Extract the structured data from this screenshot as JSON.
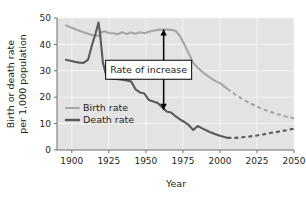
{
  "chart_data": {
    "type": "line",
    "title": "",
    "xlabel": "Year",
    "ylabel": "Birth or death rate\nper 1,000 population",
    "ylabel_line1": "Birth or death rate",
    "ylabel_line2": "per 1,000 population",
    "xlim": [
      1890,
      2050
    ],
    "ylim": [
      0,
      50
    ],
    "xticks": [
      1900,
      1925,
      1950,
      1975,
      2000,
      2025,
      2050
    ],
    "xtick_labels": [
      "1900",
      "1925",
      "1950",
      "1975",
      "2000",
      "2025",
      "2050"
    ],
    "yticks": [
      0,
      10,
      20,
      30,
      40,
      50
    ],
    "ytick_labels": [
      "0",
      "10",
      "20",
      "30",
      "40",
      "50"
    ],
    "grid": true,
    "grid_color": "#f4f4f4",
    "plot_background": "#e3e3e3",
    "legend_position": "inside-left",
    "series": [
      {
        "name": "Birth rate",
        "color": "#a6a6a6",
        "solid_x": [
          1896,
          1900,
          1903,
          1906,
          1909,
          1912,
          1915,
          1918,
          1920,
          1922,
          1925,
          1928,
          1931,
          1934,
          1937,
          1940,
          1943,
          1946,
          1949,
          1952,
          1955,
          1958,
          1961,
          1964,
          1967,
          1970,
          1973,
          1976,
          1979,
          1982,
          1985,
          1988,
          1991,
          1994,
          1997,
          2000,
          2003,
          2005
        ],
        "solid_y": [
          47.2,
          46.3,
          45.6,
          45.0,
          44.4,
          43.8,
          43.4,
          43.2,
          44.6,
          45.0,
          44.3,
          44.2,
          43.9,
          44.6,
          43.9,
          44.5,
          44.0,
          44.6,
          44.2,
          44.8,
          45.2,
          45.5,
          45.6,
          45.6,
          45.5,
          45.2,
          43.2,
          40.0,
          36.5,
          33.0,
          31.2,
          29.6,
          28.4,
          27.2,
          26.1,
          25.4,
          24.0,
          23.2
        ],
        "dashed_x": [
          2005,
          2010,
          2015,
          2020,
          2025,
          2030,
          2035,
          2040,
          2045,
          2050
        ],
        "dashed_y": [
          23.2,
          21.2,
          19.4,
          17.8,
          16.4,
          15.2,
          14.3,
          13.4,
          12.6,
          12.0
        ]
      },
      {
        "name": "Death rate",
        "color": "#5a5a5a",
        "solid_x": [
          1896,
          1899,
          1902,
          1905,
          1908,
          1911,
          1914,
          1916,
          1918,
          1919,
          1921,
          1923,
          1925,
          1928,
          1931,
          1934,
          1937,
          1940,
          1943,
          1946,
          1949,
          1952,
          1955,
          1958,
          1961,
          1964,
          1967,
          1970,
          1973,
          1976,
          1979,
          1982,
          1985,
          1988,
          1991,
          1994,
          1997,
          2000,
          2003,
          2005
        ],
        "solid_y": [
          34.2,
          33.8,
          33.4,
          33.1,
          33.0,
          34.2,
          40.5,
          44.0,
          48.3,
          44.5,
          33.0,
          28.8,
          27.2,
          27.0,
          26.8,
          26.6,
          26.3,
          26.0,
          23.0,
          21.8,
          21.4,
          18.9,
          18.4,
          17.8,
          16.2,
          14.6,
          14.2,
          12.8,
          11.6,
          10.6,
          9.4,
          7.6,
          9.1,
          8.2,
          7.4,
          6.6,
          6.0,
          5.4,
          4.9,
          4.6
        ],
        "dashed_x": [
          2005,
          2010,
          2015,
          2020,
          2025,
          2030,
          2035,
          2040,
          2045,
          2050
        ],
        "dashed_y": [
          4.6,
          4.6,
          4.8,
          5.1,
          5.5,
          6.0,
          6.5,
          7.0,
          7.5,
          8.1
        ]
      }
    ],
    "annotations": [
      {
        "text": "Rate of increase",
        "type": "double-headed-arrow-with-label",
        "x": 1962,
        "y_top": 45.6,
        "y_bottom": 15.2,
        "arrow_color": "#000000",
        "box_fill": "#ffffff",
        "box_stroke": "#000000"
      }
    ]
  },
  "legend": {
    "items": [
      {
        "label": "Birth rate",
        "color": "#a6a6a6"
      },
      {
        "label": "Death rate",
        "color": "#5a5a5a"
      }
    ]
  }
}
